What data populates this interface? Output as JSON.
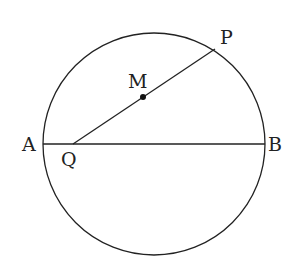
{
  "diagram": {
    "type": "geometry",
    "circle": {
      "cx": 154,
      "cy": 144,
      "r": 111
    },
    "points": {
      "A": {
        "label": "A",
        "x": 43,
        "y": 144
      },
      "B": {
        "label": "B",
        "x": 265,
        "y": 144
      },
      "P": {
        "label": "P",
        "x": 215,
        "y": 49
      },
      "Q": {
        "label": "Q",
        "x": 73,
        "y": 144
      },
      "M": {
        "label": "M",
        "x": 143,
        "y": 97
      }
    },
    "segments": [
      [
        "A",
        "B"
      ],
      [
        "Q",
        "P"
      ]
    ],
    "colors": {
      "stroke": "#222222",
      "background": "#ffffff"
    }
  }
}
